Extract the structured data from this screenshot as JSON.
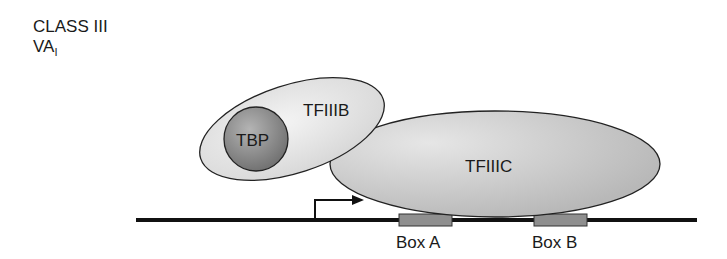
{
  "figure": {
    "heading": {
      "line1": "CLASS III",
      "line2_main": "VA",
      "line2_sub": "I"
    },
    "components": {
      "tfiiib": {
        "label": "TFIIIB",
        "color": "#e4e4e4"
      },
      "tbp": {
        "label": "TBP",
        "color": "#8c8c8c"
      },
      "tfiiic": {
        "label": "TFIIIC",
        "color": "#c8c8c8"
      }
    },
    "promoter_elements": {
      "box_a": {
        "label": "Box A",
        "color": "#8f8f8f"
      },
      "box_b": {
        "label": "Box B",
        "color": "#8f8f8f"
      }
    },
    "dna_color": "#111111",
    "start_arrow": "transcription-start-arrow"
  }
}
